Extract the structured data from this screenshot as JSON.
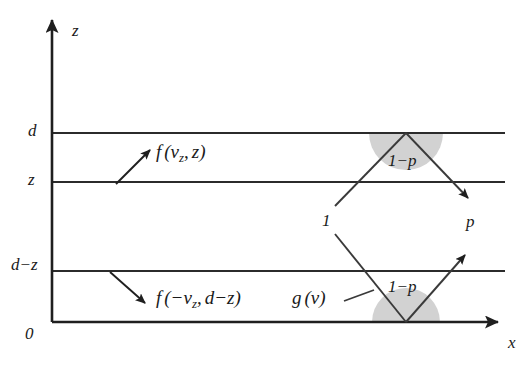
{
  "figure": {
    "background_color": "#ffffff",
    "line_color": "#2b2b2b",
    "shade_color": "#d2d2d2"
  },
  "axes": {
    "vertical_label": "z",
    "horizontal_label": "x",
    "origin_label": "0"
  },
  "ticks": [
    {
      "name": "d",
      "label": "d",
      "y": 133
    },
    {
      "name": "z",
      "label": "z",
      "y": 182
    },
    {
      "name": "d-z",
      "label": "d−z",
      "y": 271
    }
  ],
  "annotations": {
    "upper_distribution": {
      "f": "f",
      "open": "(",
      "v": "v",
      "v_sub": "z",
      "comma": ",",
      "arg2": "z",
      "close": ")"
    },
    "lower_distribution": {
      "f": "f",
      "open": "(",
      "minus": "−",
      "v": "v",
      "v_sub": "z",
      "comma": ",",
      "arg2": "d−z",
      "close": ")"
    },
    "g_of_v": {
      "g": "g",
      "open": "(",
      "v": "v",
      "close": ")"
    }
  },
  "probabilities": {
    "incident": "1",
    "transmitted": "p",
    "reflected_upper": "1−p",
    "reflected_lower": "1−p"
  }
}
